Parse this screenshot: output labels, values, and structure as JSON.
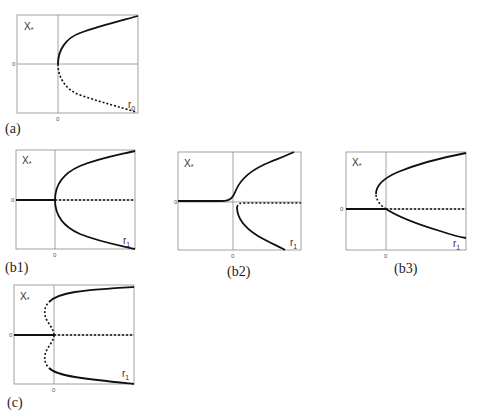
{
  "panels": [
    {
      "id": "a",
      "label": "(a)",
      "y_label": "X*",
      "x_label": "r0",
      "origin_x_tick": "0",
      "origin_y_tick": "0",
      "description": "saddle-node bifurcation"
    },
    {
      "id": "b1",
      "label": "(b1)",
      "y_label": "X*",
      "x_label": "r1",
      "origin_x_tick": "0",
      "origin_y_tick": "0",
      "description": "symmetric pitchfork"
    },
    {
      "id": "b2",
      "label": "(b2)",
      "y_label": "X*",
      "x_label": "r1",
      "origin_x_tick": "0",
      "origin_y_tick": "0",
      "description": "imperfect pitchfork"
    },
    {
      "id": "b3",
      "label": "(b3)",
      "y_label": "X*",
      "x_label": "r1",
      "origin_x_tick": "0",
      "origin_y_tick": "0",
      "description": "transcritical-like with fold"
    },
    {
      "id": "c",
      "label": "(c)",
      "y_label": "X*",
      "x_label": "r1",
      "origin_x_tick": "0",
      "origin_y_tick": "0",
      "description": "subcritical pitchfork with folds"
    }
  ],
  "legend": {
    "stable": "solid line",
    "unstable": "dashed line"
  }
}
